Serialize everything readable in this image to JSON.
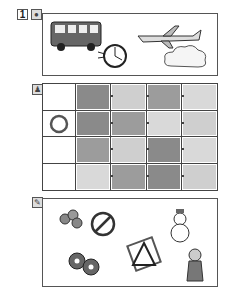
{
  "section1": {
    "number": "1",
    "icon": "circle-badge-icon",
    "items": [
      "bus",
      "clock",
      "airplane",
      "cloud"
    ]
  },
  "section2": {
    "icon": "person-icon",
    "rows": [
      {
        "label": "",
        "cells": [
          "house",
          "castle",
          "forest",
          "snow"
        ]
      },
      {
        "label": "O",
        "cells": [
          "house",
          "forest",
          "snow",
          "castle"
        ]
      },
      {
        "label": "",
        "cells": [
          "forest",
          "castle",
          "house",
          "snow"
        ]
      },
      {
        "label": "",
        "cells": [
          "snow",
          "forest",
          "house",
          "castle"
        ]
      }
    ]
  },
  "section3": {
    "icon": "pencil-icon",
    "items": [
      "donuts",
      "crossed-out-fruit",
      "snowman",
      "crossed-out-triangle",
      "donuts-pair",
      "girl"
    ]
  }
}
